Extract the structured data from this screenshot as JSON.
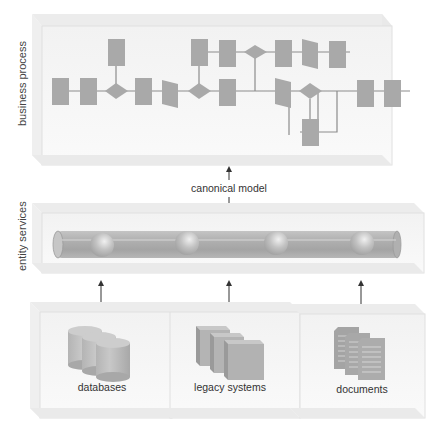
{
  "layers": {
    "business_process": {
      "label": "business process"
    },
    "canonical_model": {
      "label": "canonical model"
    },
    "entity_services": {
      "label": "entity services"
    },
    "sources": [
      {
        "label": "databases",
        "icon": "database-icon"
      },
      {
        "label": "legacy systems",
        "icon": "legacy-systems-icon"
      },
      {
        "label": "documents",
        "icon": "documents-icon"
      }
    ]
  },
  "colors": {
    "shape_fill": "#a9a9a9",
    "connector": "#8c8c8c",
    "panel_fill": "#f3f3f3",
    "panel_edge": "#d8d8d8",
    "text": "#333333"
  }
}
